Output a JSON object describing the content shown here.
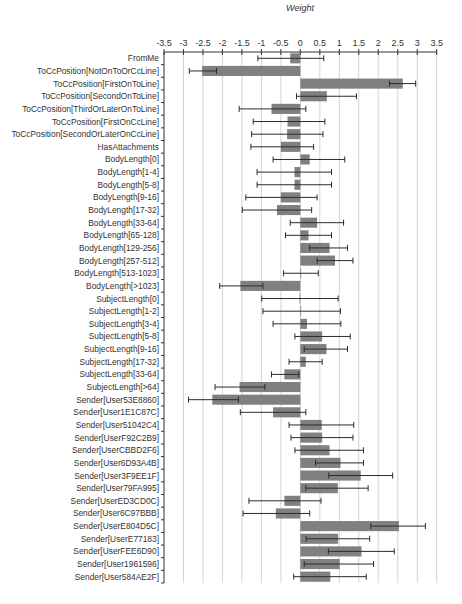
{
  "chart_data": {
    "type": "bar",
    "orientation": "horizontal",
    "title": "",
    "xlabel": "Weight",
    "ylabel": "",
    "xlim": [
      -3.5,
      3.5
    ],
    "x_ticks": [
      "-3.5",
      "-3",
      "-2.5",
      "-2",
      "-1.5",
      "-1",
      "-0.5",
      "0",
      "0.5",
      "1",
      "1.5",
      "2",
      "2.5",
      "3",
      "3.5"
    ],
    "x_tick_values": [
      -3.5,
      -3,
      -2.5,
      -2,
      -1.5,
      -1,
      -0.5,
      0,
      0.5,
      1,
      1.5,
      2,
      2.5,
      3,
      3.5
    ],
    "grid": true,
    "legend": null,
    "bar_color": "#808080",
    "error_bar_color": "#2b2b2b",
    "grid_color": "#d4d4d4",
    "categories": [
      "FromMe",
      "ToCcPosition[NotOnToOrCcLine]",
      "ToCcPosition[FirstOnToLine]",
      "ToCcPosition[SecondOnToLine]",
      "ToCcPosition[ThirdOrLaterOnToLine]",
      "ToCcPosition[FirstOnCcLine]",
      "ToCcPosition[SecondOrLaterOnCcLine]",
      "HasAttachments",
      "BodyLength[0]",
      "BodyLength[1-4]",
      "BodyLength[5-8]",
      "BodyLength[9-16]",
      "BodyLength[17-32]",
      "BodyLength[33-64]",
      "BodyLength[65-128]",
      "BodyLength[129-256]",
      "BodyLength[257-512]",
      "BodyLength[513-1023]",
      "BodyLength[>1023]",
      "SubjectLength[0]",
      "SubjectLength[1-2]",
      "SubjectLength[3-4]",
      "SubjectLength[5-8]",
      "SubjectLength[9-16]",
      "SubjectLength[17-32]",
      "SubjectLength[33-64]",
      "SubjectLength[>64]",
      "Sender[User53E8860]",
      "Sender[User1E1C87C]",
      "Sender[User51042C4]",
      "Sender[UserF92C2B9]",
      "Sender[UserCBBD2F6]",
      "Sender[User6D93A4B]",
      "Sender[User3F9EE1F]",
      "Sender[User79FA995]",
      "Sender[UserED3CD0C]",
      "Sender[User6C97BBB]",
      "Sender[UserE804D5C]",
      "Sender[UserE77183]",
      "Sender[UserFEE6D90]",
      "Sender[User1961596]",
      "Sender[User584AE2F]"
    ],
    "series": [
      {
        "name": "Weight",
        "values": [
          -0.26,
          -2.52,
          2.63,
          0.68,
          -0.74,
          -0.33,
          -0.34,
          -0.5,
          0.24,
          -0.15,
          -0.15,
          -0.5,
          -0.6,
          0.43,
          0.21,
          0.75,
          0.89,
          0.01,
          -1.54,
          -0.02,
          0.01,
          0.17,
          0.56,
          0.67,
          0.14,
          -0.41,
          -1.56,
          -2.26,
          -0.7,
          0.55,
          0.56,
          0.75,
          1.03,
          1.55,
          0.96,
          -0.41,
          -0.63,
          2.53,
          0.97,
          1.57,
          1.01,
          0.77
        ],
        "error_low": [
          -1.09,
          -2.85,
          2.29,
          -0.1,
          -1.57,
          -1.21,
          -1.25,
          -1.27,
          -0.7,
          -1.11,
          -1.11,
          -1.4,
          -1.49,
          -0.26,
          -0.38,
          0.24,
          0.43,
          -0.43,
          -2.07,
          -0.99,
          -0.96,
          -0.7,
          -0.14,
          0.1,
          -0.29,
          -0.74,
          -2.19,
          -2.87,
          -1.54,
          -0.29,
          -0.24,
          -0.14,
          0.39,
          0.73,
          0.14,
          -1.32,
          -1.47,
          1.81,
          0.15,
          0.72,
          0.1,
          -0.17
        ],
        "error_high": [
          0.6,
          -2.15,
          2.96,
          1.44,
          0.14,
          0.63,
          0.58,
          0.34,
          1.14,
          0.8,
          0.8,
          0.43,
          0.29,
          1.11,
          0.8,
          1.21,
          1.35,
          0.46,
          -0.96,
          0.97,
          1.03,
          1.04,
          1.28,
          1.21,
          0.56,
          -0.04,
          -0.91,
          -1.59,
          0.14,
          1.37,
          1.35,
          1.62,
          1.62,
          2.37,
          1.74,
          0.53,
          0.24,
          3.21,
          1.78,
          2.41,
          1.88,
          1.69
        ]
      }
    ]
  }
}
